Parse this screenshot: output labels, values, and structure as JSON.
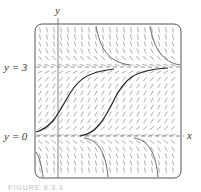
{
  "figure": {
    "type": "slope_field",
    "y_axis_label": "y",
    "x_axis_label": "x",
    "equilibria": [
      {
        "label": "y = 3",
        "value": 3
      },
      {
        "label": "y = 0",
        "value": 0
      }
    ],
    "caption": "FIGURE 9.3.1"
  },
  "colors": {
    "frame": "#555555",
    "axis": "#777777",
    "slope_marks": "#8a8a8a",
    "solution_dark": "#222222",
    "solution_gray": "#6a6a6a",
    "equilibrium_dash": "#888888"
  }
}
